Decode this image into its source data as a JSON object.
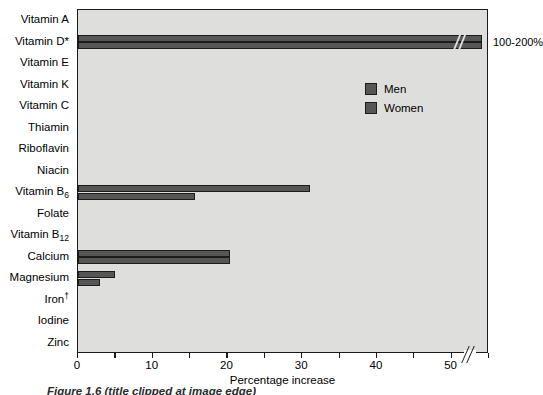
{
  "chart_data": {
    "type": "bar",
    "orientation": "horizontal",
    "title": "",
    "xlabel": "Percentage increase",
    "ylabel": "",
    "xlim": [
      0,
      55
    ],
    "xticks": [
      0,
      5,
      10,
      15,
      20,
      25,
      30,
      35,
      40,
      45,
      50,
      55
    ],
    "xticklabels": [
      "0",
      "",
      "10",
      "",
      "20",
      "",
      "30",
      "",
      "40",
      "",
      "50",
      ""
    ],
    "grid": false,
    "axis_break": {
      "after": 50,
      "label": "100-200%"
    },
    "legend": [
      "Men",
      "Women"
    ],
    "legend_position": "upper right",
    "categories": [
      "Vitamin A",
      "Vitamin D*",
      "Vitamin E",
      "Vitamin K",
      "Vitamin C",
      "Thiamin",
      "Riboflavin",
      "Niacin",
      "Vitamin B6",
      "Folate",
      "Vitamin B12",
      "Calcium",
      "Magnesium",
      "Iron†",
      "Iodine",
      "Zinc"
    ],
    "series": [
      {
        "name": "Men",
        "values": [
          0,
          54,
          0,
          0,
          0,
          0,
          0,
          0,
          31,
          0,
          0,
          20.3,
          5,
          0,
          0,
          0
        ]
      },
      {
        "name": "Women",
        "values": [
          0,
          54,
          0,
          0,
          0,
          0,
          0,
          0,
          15.7,
          0,
          0,
          20.3,
          3,
          0,
          0,
          0
        ]
      }
    ]
  },
  "axis": {
    "categories": [
      {
        "text": "Vitamin A",
        "sub": "",
        "sup": ""
      },
      {
        "text": "Vitamin D*",
        "sub": "",
        "sup": ""
      },
      {
        "text": "Vitamin E",
        "sub": "",
        "sup": ""
      },
      {
        "text": "Vitamin K",
        "sub": "",
        "sup": ""
      },
      {
        "text": "Vitamin C",
        "sub": "",
        "sup": ""
      },
      {
        "text": "Thiamin",
        "sub": "",
        "sup": ""
      },
      {
        "text": "Riboflavin",
        "sub": "",
        "sup": ""
      },
      {
        "text": "Niacin",
        "sub": "",
        "sup": ""
      },
      {
        "text": "Vitamin B",
        "sub": "6",
        "sup": ""
      },
      {
        "text": "Folate",
        "sub": "",
        "sup": ""
      },
      {
        "text": "Vitamin B",
        "sub": "12",
        "sup": ""
      },
      {
        "text": "Calcium",
        "sub": "",
        "sup": ""
      },
      {
        "text": "Magnesium",
        "sub": "",
        "sup": ""
      },
      {
        "text": "Iron",
        "sub": "",
        "sup": "†"
      },
      {
        "text": "Iodine",
        "sub": "",
        "sup": ""
      },
      {
        "text": "Zinc",
        "sub": "",
        "sup": ""
      }
    ]
  },
  "annotations": {
    "over_scale_label": "100-200%"
  },
  "caption": {
    "text": "Figure 1.6 (title clipped at image edge)"
  },
  "colors": {
    "bar_fill": "#565656",
    "bar_edge": "#1c1c1c",
    "plot_background": "#dededd",
    "page_background": "#ffffff",
    "axis": "#1a1a1a"
  }
}
